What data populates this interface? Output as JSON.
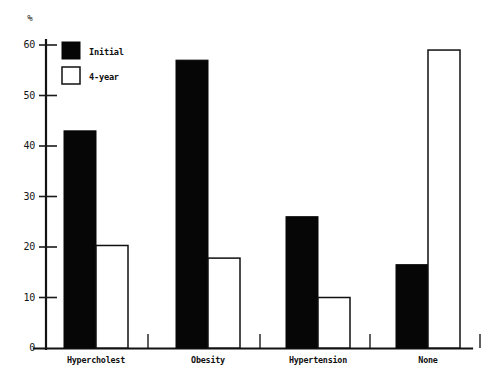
{
  "chart_data": {
    "type": "bar",
    "title": "",
    "subtitle": "",
    "xlabel": "",
    "ylabel": "%",
    "unit_symbol": "%",
    "categories": [
      "Hypercholest",
      "Obesity",
      "Hypertension",
      "None"
    ],
    "series": [
      {
        "name": "Initial",
        "style": "filled",
        "values": [
          43,
          57,
          26,
          16.5
        ]
      },
      {
        "name": "4-year",
        "style": "open",
        "values": [
          20.3,
          17.8,
          10,
          59
        ]
      }
    ],
    "ylim": [
      0,
      60
    ],
    "yticks": [
      0,
      10,
      20,
      30,
      40,
      50,
      60
    ],
    "ytick_labels": [
      "0",
      "10",
      "20",
      "30",
      "40",
      "50",
      "60"
    ],
    "grid": false,
    "legend": {
      "position": "top-left-inside",
      "entries": [
        {
          "label": "Initial",
          "style": "filled"
        },
        {
          "label": "4-year",
          "style": "open"
        }
      ]
    },
    "colors": {
      "filled": "#060606",
      "open_fill": "#ffffff",
      "open_stroke": "#101010",
      "axis": "#121212",
      "background": "#ffffff"
    }
  },
  "layout": {
    "plot_left": 46,
    "plot_right": 472,
    "plot_top": 18,
    "baseline_y": 348,
    "y_top_value_y": 45,
    "bar_width": 32,
    "group_centers": [
      96,
      208,
      318,
      428
    ]
  }
}
